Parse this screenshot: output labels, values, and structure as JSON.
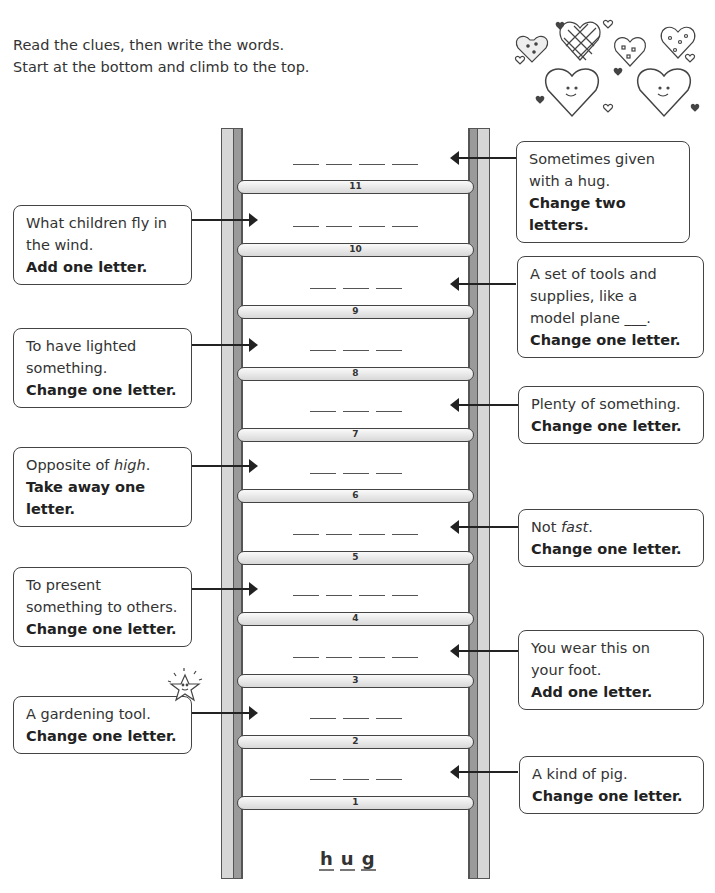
{
  "instructions": {
    "line1": "Read the clues, then write the words.",
    "line2": "Start at the bottom and climb to the top."
  },
  "decoration": {
    "top_right": "hearts-illustration",
    "star": "smiling-star"
  },
  "start_word": {
    "letters": [
      "h",
      "u",
      "g"
    ]
  },
  "rungs": [
    {
      "number": "11",
      "blanks": 4
    },
    {
      "number": "10",
      "blanks": 4
    },
    {
      "number": "9",
      "blanks": 3
    },
    {
      "number": "8",
      "blanks": 3
    },
    {
      "number": "7",
      "blanks": 3
    },
    {
      "number": "6",
      "blanks": 3
    },
    {
      "number": "5",
      "blanks": 4
    },
    {
      "number": "4",
      "blanks": 4
    },
    {
      "number": "3",
      "blanks": 4
    },
    {
      "number": "2",
      "blanks": 3
    },
    {
      "number": "1",
      "blanks": 3
    }
  ],
  "clues": {
    "c11": {
      "rung": "11",
      "side": "right",
      "text": "Sometimes given with a hug.",
      "line1": "Sometimes given",
      "line2": "with a hug.",
      "instruction": "Change two letters."
    },
    "c10": {
      "rung": "10",
      "side": "left",
      "line1": "What children fly in",
      "line2": "the wind.",
      "instruction": "Add one letter."
    },
    "c9": {
      "rung": "9",
      "side": "right",
      "line1": "A set of tools and",
      "line2": "supplies, like a",
      "line3": "model plane ___.",
      "instruction": "Change one letter."
    },
    "c8": {
      "rung": "8",
      "side": "left",
      "line1": "To have lighted",
      "line2": "something.",
      "instruction": "Change one letter."
    },
    "c7": {
      "rung": "7",
      "side": "right",
      "line1": "Plenty of something.",
      "instruction": "Change one letter."
    },
    "c6": {
      "rung": "6",
      "side": "left",
      "line1_prefix": "Opposite of ",
      "line1_italic": "high",
      "line1_suffix": ".",
      "instruction1": "Take away one",
      "instruction2": "letter."
    },
    "c5": {
      "rung": "5",
      "side": "right",
      "line1_prefix": "Not ",
      "line1_italic": "fast",
      "line1_suffix": ".",
      "instruction": "Change one letter."
    },
    "c4": {
      "rung": "4",
      "side": "left",
      "line1": "To present",
      "line2": "something to others.",
      "instruction": "Change one letter."
    },
    "c3": {
      "rung": "3",
      "side": "right",
      "line1": "You wear this on",
      "line2": "your foot.",
      "instruction": "Add one letter."
    },
    "c2": {
      "rung": "2",
      "side": "left",
      "line1": "A gardening tool.",
      "instruction": "Change one letter."
    },
    "c1": {
      "rung": "1",
      "side": "right",
      "line1": "A kind of pig.",
      "instruction": "Change one letter."
    }
  }
}
